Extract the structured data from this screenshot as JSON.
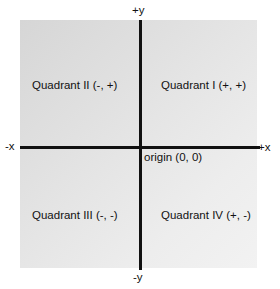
{
  "axes": {
    "y_positive": "+y",
    "y_negative": "-y",
    "x_positive": "+x",
    "x_negative": "-x"
  },
  "origin": "origin (0, 0)",
  "quadrants": [
    {
      "label": "Quadrant I (+, +)"
    },
    {
      "label": "Quadrant II (-, +)"
    },
    {
      "label": "Quadrant III (-, -)"
    },
    {
      "label": "Quadrant IV (+, -)"
    }
  ]
}
